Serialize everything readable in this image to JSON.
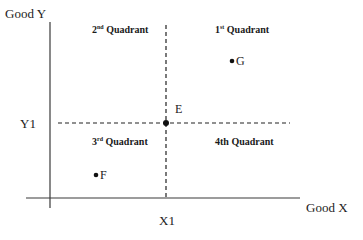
{
  "diagram": {
    "type": "quadrant-diagram",
    "axes": {
      "y_axis_label": "Good Y",
      "x_axis_label": "Good X",
      "y_reference_label": "Y1",
      "x_reference_label": "X1"
    },
    "quadrants": [
      {
        "id": "q1",
        "number": "1",
        "suffix": "st",
        "text": "Quadrant"
      },
      {
        "id": "q2",
        "number": "2",
        "suffix": "nd",
        "text": "Quadrant"
      },
      {
        "id": "q3",
        "number": "3",
        "suffix": "rd",
        "text": "Quadrant"
      },
      {
        "id": "q4",
        "number": "4th",
        "suffix": "",
        "text": "Quadrant"
      }
    ],
    "points": [
      {
        "name": "E",
        "position": "intersection of X1 and Y1"
      },
      {
        "name": "G",
        "quadrant": "1st"
      },
      {
        "name": "F",
        "quadrant": "3rd"
      }
    ],
    "colors": {
      "line": "#333333",
      "text": "#1a1a1a",
      "background": "#ffffff"
    }
  }
}
